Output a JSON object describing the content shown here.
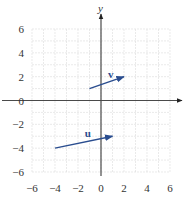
{
  "chart_data": {
    "type": "vector-plot",
    "title": "",
    "xlabel": "",
    "ylabel": "y",
    "xlim": [
      -6,
      6
    ],
    "ylim": [
      -6,
      6
    ],
    "grid": true,
    "grid_step": 1,
    "x_ticks": [
      -6,
      -4,
      -2,
      0,
      2,
      4,
      6
    ],
    "y_ticks": [
      6,
      4,
      2,
      0,
      -2,
      -4,
      -6
    ],
    "x_tick_labels": [
      "−6",
      "−4",
      "−2",
      "0",
      "2",
      "4",
      "6"
    ],
    "y_tick_labels": [
      "6",
      "4",
      "2",
      "0",
      "−2",
      "−4",
      "−6"
    ],
    "vectors": [
      {
        "name": "v",
        "label": "v",
        "from": [
          -1,
          1
        ],
        "to": [
          2,
          2
        ],
        "color": "#2a4d8f"
      },
      {
        "name": "u",
        "label": "u",
        "from": [
          -4,
          -4
        ],
        "to": [
          1,
          -3
        ],
        "color": "#2a4d8f"
      }
    ]
  }
}
